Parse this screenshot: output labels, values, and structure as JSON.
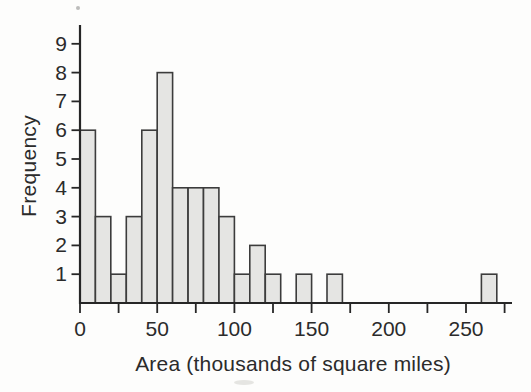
{
  "chart_data": {
    "type": "bar",
    "subtype": "histogram",
    "title": "",
    "xlabel": "Area (thousands of square miles)",
    "ylabel": "Frequency",
    "bin_width": 10,
    "bin_edges": [
      0,
      10,
      20,
      30,
      40,
      50,
      60,
      70,
      80,
      90,
      100,
      110,
      120,
      130,
      140,
      150,
      160,
      170,
      180,
      190,
      200,
      210,
      220,
      230,
      240,
      250,
      260,
      270
    ],
    "frequencies": [
      6,
      3,
      1,
      3,
      6,
      8,
      4,
      4,
      4,
      3,
      1,
      2,
      1,
      0,
      1,
      0,
      1,
      0,
      0,
      0,
      0,
      0,
      0,
      0,
      0,
      0,
      1
    ],
    "y_ticks": [
      1,
      2,
      3,
      4,
      5,
      6,
      7,
      8,
      9
    ],
    "x_ticks_major": [
      0,
      50,
      100,
      150,
      200,
      250
    ],
    "x_ticks_minor": [
      25,
      75,
      125,
      175,
      225,
      275
    ],
    "xlim": [
      0,
      280
    ],
    "ylim": [
      0,
      9.65
    ],
    "grid": false,
    "legend": false,
    "colors": {
      "bar_fill": "#e5e5e3",
      "bar_border": "#3c3c3c",
      "axis": "#262626",
      "text": "#2b2b2b",
      "background": "#fdfdfc"
    }
  }
}
